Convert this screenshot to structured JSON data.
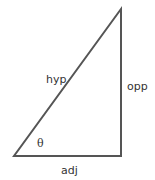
{
  "diagram": {
    "stroke_color": "#555555",
    "vertices": {
      "bottom_left": [
        14,
        156
      ],
      "bottom_right": [
        121,
        156
      ],
      "top_right": [
        121,
        9
      ]
    },
    "labels": {
      "hypotenuse": "hyp",
      "opposite": "opp",
      "adjacent": "adj",
      "angle": "θ"
    }
  }
}
